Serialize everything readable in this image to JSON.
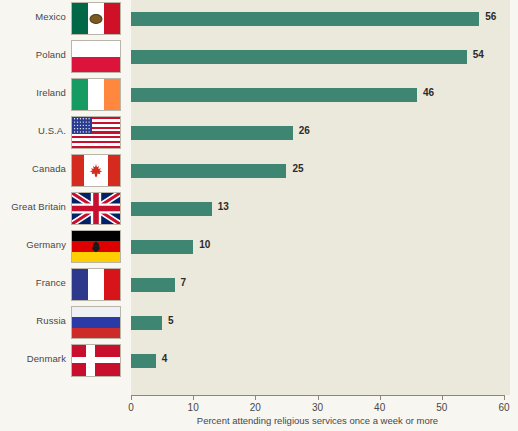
{
  "chart_data": {
    "type": "bar",
    "orientation": "horizontal",
    "title": "",
    "xlabel": "Percent attending religious services once a week or more",
    "ylabel": "",
    "xlim": [
      0,
      60
    ],
    "xticks": [
      0,
      10,
      20,
      30,
      40,
      50,
      60
    ],
    "grid": false,
    "legend": null,
    "bar_color": "#3f8672",
    "plot_background": "#ebe8dc",
    "categories": [
      "Mexico",
      "Poland",
      "Ireland",
      "U.S.A.",
      "Canada",
      "Great Britain",
      "Germany",
      "France",
      "Russia",
      "Denmark"
    ],
    "values": [
      56,
      54,
      46,
      26,
      25,
      13,
      10,
      7,
      5,
      4
    ],
    "data_labels": [
      "56",
      "54",
      "46",
      "26",
      "25",
      "13",
      "10",
      "7",
      "5",
      "4"
    ],
    "rows": [
      {
        "label": "Mexico",
        "value": 56,
        "value_text": "56",
        "flag": "flag-mexico"
      },
      {
        "label": "Poland",
        "value": 54,
        "value_text": "54",
        "flag": "flag-poland"
      },
      {
        "label": "Ireland",
        "value": 46,
        "value_text": "46",
        "flag": "flag-ireland"
      },
      {
        "label": "U.S.A.",
        "value": 26,
        "value_text": "26",
        "flag": "flag-usa"
      },
      {
        "label": "Canada",
        "value": 25,
        "value_text": "25",
        "flag": "flag-canada"
      },
      {
        "label": "Great Britain",
        "value": 13,
        "value_text": "13",
        "flag": "flag-great-britain"
      },
      {
        "label": "Germany",
        "value": 10,
        "value_text": "10",
        "flag": "flag-germany"
      },
      {
        "label": "France",
        "value": 7,
        "value_text": "7",
        "flag": "flag-france"
      },
      {
        "label": "Russia",
        "value": 5,
        "value_text": "5",
        "flag": "flag-russia"
      },
      {
        "label": "Denmark",
        "value": 4,
        "value_text": "4",
        "flag": "flag-denmark"
      }
    ]
  },
  "axis": {
    "tick_labels": [
      "0",
      "10",
      "20",
      "30",
      "40",
      "50",
      "60"
    ],
    "title": "Percent attending religious services once a week or more"
  }
}
